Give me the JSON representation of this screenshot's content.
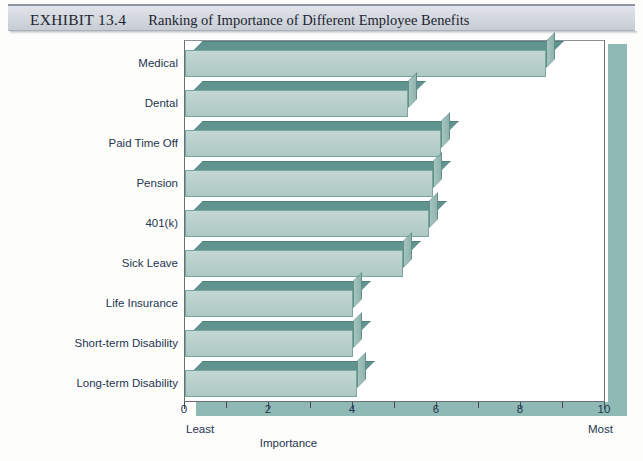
{
  "header": {
    "kicker": "EXHIBIT 13.4",
    "title": "Ranking of Importance of Different Employee Benefits"
  },
  "colors": {
    "bar_front": "#b7cfca",
    "bar_top": "#61948f",
    "bar_side": "#8fb3ae",
    "band": "#8fb9b4",
    "header_band": "#d5d9e0",
    "text": "#1f3550"
  },
  "chart_data": {
    "type": "bar",
    "orientation": "horizontal",
    "title": "Ranking of Importance of Different Employee Benefits",
    "xlabel": "Importance",
    "ylabel": "",
    "xlim": [
      0,
      10
    ],
    "grid": false,
    "legend": null,
    "axis_min_label": "Least",
    "axis_max_label": "Most",
    "xticks": [
      0,
      1,
      2,
      3,
      4,
      5,
      6,
      7,
      8,
      9,
      10
    ],
    "xticklabels": [
      "0",
      "",
      "2",
      "",
      "4",
      "",
      "6",
      "",
      "8",
      "",
      "10"
    ],
    "categories": [
      "Medical",
      "Dental",
      "Paid Time Off",
      "Pension",
      "401(k)",
      "Sick Leave",
      "Life Insurance",
      "Short-term Disability",
      "Long-term Disability"
    ],
    "values": [
      8.6,
      5.3,
      6.1,
      5.9,
      5.8,
      5.2,
      4.0,
      4.0,
      4.1
    ]
  }
}
